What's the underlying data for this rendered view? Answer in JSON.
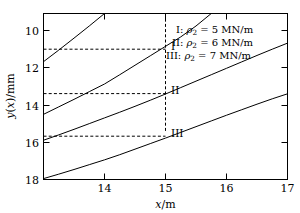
{
  "chart_data": {
    "type": "line",
    "title": "",
    "xlabel": "x/m",
    "ylabel": "y(x)/mm",
    "xlim": [
      13.5,
      17.5
    ],
    "ylim": [
      18.6,
      9.3
    ],
    "y_axis_inverted": true,
    "grid": false,
    "legend_position": "top-right",
    "xticks": [
      14,
      15,
      16,
      17
    ],
    "xtick_labels": [
      "14",
      "15",
      "16",
      "17"
    ],
    "yticks": [
      10,
      12,
      14,
      16,
      18
    ],
    "ytick_labels": [
      "10",
      "12",
      "14",
      "16",
      "18"
    ],
    "series": [
      {
        "name": "I",
        "legend_label": "I: ρ₂ = 5 MN/m",
        "parameter_symbol": "ρ",
        "parameter_subscript": "2",
        "parameter_value": 5,
        "parameter_unit": "MN/m",
        "x": [
          13.5,
          13.75,
          14.0,
          14.25,
          14.5,
          14.75,
          15.0,
          15.25,
          15.5,
          15.75,
          16.0,
          16.25,
          16.5,
          16.75,
          17.0,
          17.25,
          17.5
        ],
        "y": [
          9.35,
          9.6,
          9.86,
          10.13,
          10.4,
          10.69,
          11.0,
          11.31,
          11.62,
          11.94,
          12.26,
          12.58,
          12.9,
          13.21,
          13.52,
          13.82,
          14.1
        ]
      },
      {
        "name": "II",
        "legend_label": "II: ρ₂ = 6 MN/m",
        "parameter_symbol": "ρ",
        "parameter_subscript": "2",
        "parameter_value": 6,
        "parameter_unit": "MN/m",
        "x": [
          13.5,
          13.75,
          14.0,
          14.25,
          14.5,
          14.75,
          15.0,
          15.25,
          15.5,
          15.75,
          16.0,
          16.25,
          16.5,
          16.75,
          17.0,
          17.25,
          17.5
        ],
        "y": [
          11.5,
          11.8,
          12.11,
          12.43,
          12.75,
          13.07,
          13.4,
          13.74,
          14.09,
          14.45,
          14.81,
          15.17,
          15.53,
          15.89,
          16.25,
          16.6,
          16.94
        ]
      },
      {
        "name": "III",
        "legend_label": "III: ρ₂ = 7 MN/m",
        "parameter_symbol": "ρ",
        "parameter_subscript": "2",
        "parameter_value": 7,
        "parameter_unit": "MN/m",
        "x": [
          13.5,
          13.75,
          14.0,
          14.25,
          14.5,
          14.75,
          15.0,
          15.25,
          15.5,
          15.75,
          16.0,
          16.25
        ],
        "y": [
          12.95,
          13.37,
          13.79,
          14.22,
          14.65,
          15.17,
          15.7,
          16.23,
          16.76,
          17.29,
          17.9,
          18.6
        ]
      },
      {
        "name": "unlabeled-lower",
        "legend_label": "",
        "x": [
          13.5,
          13.75,
          14.0,
          14.25,
          14.5
        ],
        "y": [
          15.9,
          16.55,
          17.22,
          17.9,
          18.6
        ]
      }
    ],
    "annotations": [
      {
        "label": "I",
        "x": 15.12,
        "y": 10.82
      },
      {
        "label": "II",
        "x": 15.12,
        "y": 13.2
      },
      {
        "label": "III",
        "x": 15.12,
        "y": 15.52
      }
    ],
    "reference_lines": {
      "vertical": {
        "x": 15,
        "style": "dashed"
      },
      "horizontal": [
        {
          "y": 11.0,
          "x_from": 13.5,
          "x_to": 15,
          "style": "dashed"
        },
        {
          "y": 13.4,
          "x_from": 13.5,
          "x_to": 15,
          "style": "dashed"
        },
        {
          "y": 15.7,
          "x_from": 13.5,
          "x_to": 15,
          "style": "dashed"
        }
      ]
    }
  },
  "legend": {
    "entries": [
      {
        "name": "I",
        "separator": ":",
        "symbol": "ρ",
        "subscript": "2",
        "equals": "=",
        "value": "5",
        "unit": "MN/m"
      },
      {
        "name": "II",
        "separator": ":",
        "symbol": "ρ",
        "subscript": "2",
        "equals": "=",
        "value": "6",
        "unit": "MN/m"
      },
      {
        "name": "III",
        "separator": ":",
        "symbol": "ρ",
        "subscript": "2",
        "equals": "=",
        "value": "7",
        "unit": "MN/m"
      }
    ]
  },
  "axes": {
    "x_title_symbol": "x",
    "x_title_unit": "/m",
    "y_title_symbol": "y",
    "y_title_arg_open": "(",
    "y_title_arg": "x",
    "y_title_arg_close": ")",
    "y_title_unit": "/mm"
  }
}
